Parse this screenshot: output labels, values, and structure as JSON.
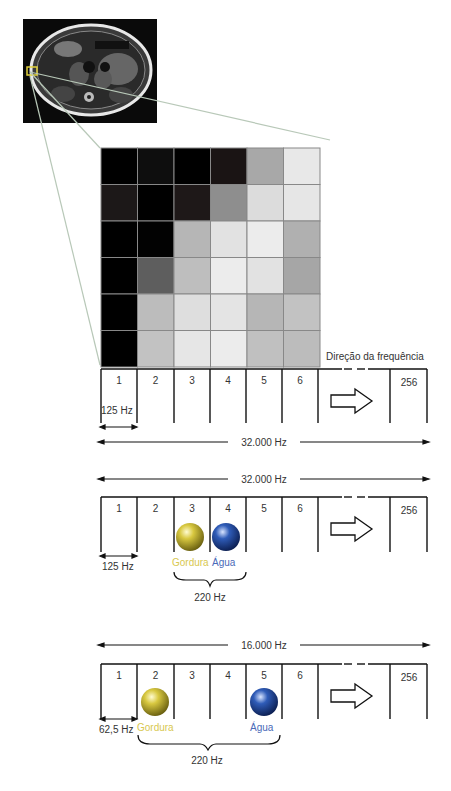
{
  "image": {
    "label": "MRI axial abdomen",
    "highlight_color": "#e2d23c"
  },
  "pixel_grid": {
    "rows": 6,
    "cols": 6,
    "gray_values": [
      [
        "#000000",
        "#0e0e0e",
        "#000000",
        "#1a1414",
        "#a8a8a8",
        "#e8e8e8"
      ],
      [
        "#1c1818",
        "#000000",
        "#1e1818",
        "#8e8e8e",
        "#dcdcdc",
        "#e6e6e6"
      ],
      [
        "#000000",
        "#020202",
        "#b6b6b6",
        "#e2e2e2",
        "#ececec",
        "#b0b0b0"
      ],
      [
        "#000000",
        "#5e5e5e",
        "#bebebe",
        "#ececec",
        "#e2e2e2",
        "#a6a6a6"
      ],
      [
        "#000000",
        "#bcbcbc",
        "#dedede",
        "#e4e4e4",
        "#b6b6b6",
        "#c2c2c2"
      ],
      [
        "#000000",
        "#c2c2c2",
        "#e6e6e6",
        "#ececec",
        "#c0c0c0",
        "#bcbcbc"
      ]
    ]
  },
  "diagram1": {
    "direction_label": "Direção da frequência",
    "cells": [
      "1",
      "2",
      "3",
      "4",
      "5",
      "6",
      "256"
    ],
    "pixel_bandwidth": "125 Hz",
    "total_bandwidth": "32.000 Hz"
  },
  "diagram2": {
    "total_bandwidth": "32.000 Hz",
    "cells": [
      "1",
      "2",
      "3",
      "4",
      "5",
      "6",
      "256"
    ],
    "pixel_bandwidth": "125 Hz",
    "fat_label": "Gordura",
    "water_label": "Água",
    "shift": "220 Hz"
  },
  "diagram3": {
    "total_bandwidth": "16.000 Hz",
    "cells": [
      "1",
      "2",
      "3",
      "4",
      "5",
      "6",
      "256"
    ],
    "pixel_bandwidth": "62,5 Hz",
    "fat_label": "Gordura",
    "water_label": "Água",
    "shift": "220 Hz"
  },
  "colors": {
    "fat": "#c8b830",
    "water": "#2a4fa0",
    "fat_text": "#d8c850",
    "water_text": "#4a6ab8",
    "lines": "#111111",
    "callout": "#b8c8b8"
  }
}
